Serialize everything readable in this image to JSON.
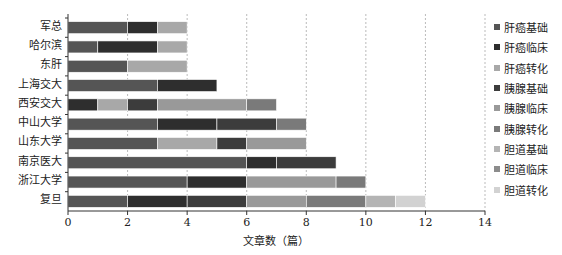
{
  "chart_data": {
    "type": "bar",
    "orientation": "horizontal",
    "stacked": true,
    "title": "",
    "xlabel": "文章数（篇）",
    "ylabel": "",
    "xlim": [
      0,
      14
    ],
    "xticks": [
      0,
      2,
      4,
      6,
      8,
      10,
      12,
      14
    ],
    "grid": "vertical dashed",
    "legend_position": "right",
    "categories": [
      "军总",
      "哈尔滨",
      "东肝",
      "上海交大",
      "西安交大",
      "中山大学",
      "山东大学",
      "南京医大",
      "浙江大学",
      "复旦"
    ],
    "series": [
      {
        "name": "肝癌基础",
        "color": "#555555",
        "values": [
          2,
          1,
          2,
          3,
          0,
          3,
          3,
          6,
          4,
          2
        ]
      },
      {
        "name": "肝癌临床",
        "color": "#2e2e2e",
        "values": [
          1,
          2,
          0,
          2,
          1,
          2,
          0,
          1,
          2,
          2
        ]
      },
      {
        "name": "肝癌转化",
        "color": "#a8a8a8",
        "values": [
          1,
          1,
          2,
          0,
          1,
          0,
          2,
          0,
          0,
          0
        ]
      },
      {
        "name": "胰腺基础",
        "color": "#3c3c3c",
        "values": [
          0,
          0,
          0,
          0,
          1,
          2,
          1,
          2,
          0,
          2
        ]
      },
      {
        "name": "胰腺临床",
        "color": "#999999",
        "values": [
          0,
          0,
          0,
          0,
          3,
          0,
          2,
          0,
          3,
          2
        ]
      },
      {
        "name": "胰腺转化",
        "color": "#7a7a7a",
        "values": [
          0,
          0,
          0,
          0,
          1,
          1,
          0,
          0,
          1,
          2
        ]
      },
      {
        "name": "胆道基础",
        "color": "#b4b4b4",
        "values": [
          0,
          0,
          0,
          0,
          0,
          0,
          0,
          0,
          0,
          1
        ]
      },
      {
        "name": "胆道临床",
        "color": "#8c8c8c",
        "values": [
          0,
          0,
          0,
          0,
          0,
          0,
          0,
          0,
          0,
          0
        ]
      },
      {
        "name": "胆道转化",
        "color": "#d2d2d2",
        "values": [
          0,
          0,
          0,
          0,
          0,
          0,
          0,
          0,
          0,
          1
        ]
      }
    ],
    "totals": [
      4,
      4,
      4,
      5,
      7,
      8,
      8,
      9,
      10,
      12
    ]
  },
  "labels": {
    "x_title": "文章数（篇）",
    "ticks": [
      "0",
      "2",
      "4",
      "6",
      "8",
      "10",
      "12",
      "14"
    ]
  }
}
